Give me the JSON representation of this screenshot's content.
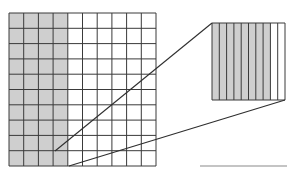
{
  "diagram": {
    "main_grid": {
      "rows": 10,
      "cols": 10,
      "shaded_cols": 4,
      "x": 9,
      "y": 13,
      "width": 147,
      "height": 153
    },
    "magnified_cell": {
      "strips": 10,
      "shaded_strips": 8,
      "x": 212,
      "y": 23,
      "width": 73,
      "height": 77
    },
    "connector_lines": [
      {
        "x1": 55,
        "y1": 151,
        "x2": 212,
        "y2": 23
      },
      {
        "x1": 69,
        "y1": 166,
        "x2": 285,
        "y2": 100
      }
    ],
    "answer_line": {
      "x1": 200,
      "y1": 166,
      "x2": 287,
      "y2": 166
    },
    "colors": {
      "shade": "#cfcfcf",
      "grid_line": "#3a3a3a",
      "connector": "#2e2e2e",
      "answer_line": "#8a8a8a",
      "background": "#ffffff"
    }
  }
}
